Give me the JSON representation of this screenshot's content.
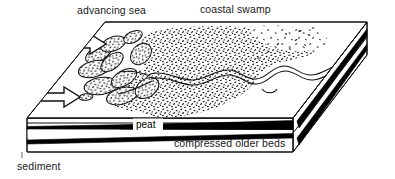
{
  "diagram": {
    "type": "geological-block-diagram",
    "canvas": {
      "width": 395,
      "height": 179,
      "background": "#ffffff"
    },
    "labels": {
      "advancing_sea": "advancing sea",
      "coastal_swamp": "coastal swamp",
      "peat": "peat",
      "compressed_older_beds": "compressed older beds",
      "sediment": "sediment"
    },
    "colors": {
      "ink": "#111111",
      "bed_fill": "#000000",
      "face_fill": "#ffffff",
      "stipple": "#1a1a1a"
    },
    "features": {
      "arrow_count": 2,
      "arrow_direction": "right",
      "arrow_meaning": "direction of sea advance",
      "river_channel": "meandering stream with oxbow",
      "swamp_texture": "stipple",
      "delta_lobes": "drowned lobate marsh islands",
      "strata_order": [
        "sediment",
        "peat",
        "compressed older beds"
      ]
    }
  }
}
